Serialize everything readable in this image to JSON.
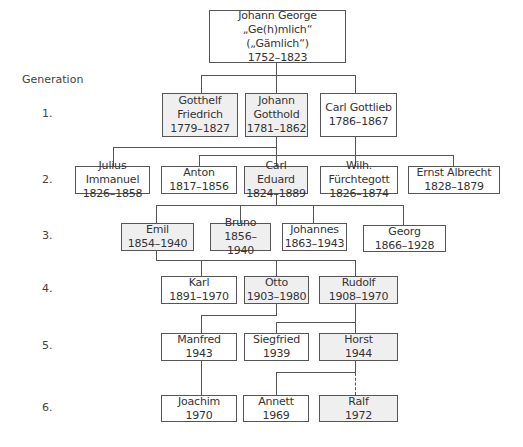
{
  "legend": {
    "generation_label": "Generation",
    "generations": [
      "1.",
      "2.",
      "3.",
      "4.",
      "5.",
      "6."
    ]
  },
  "colors": {
    "box_border": "#555555",
    "shaded_fill": "#efefef",
    "plain_fill": "#ffffff",
    "line": "#555555"
  },
  "root": {
    "lines": [
      "Johann George „Ge(h)mlich“",
      "(„Gämlich“)",
      "1752–1823"
    ],
    "shaded": false
  },
  "people": {
    "gotthelf": {
      "lines": [
        "Gotthelf",
        "Friedrich",
        "1779–1827"
      ],
      "shaded": true,
      "generation": 1
    },
    "johann_gotthold": {
      "lines": [
        "Johann",
        "Gotthold",
        "1781–1862"
      ],
      "shaded": true,
      "generation": 1
    },
    "carl_gottlieb": {
      "lines": [
        "Carl Gottlieb",
        "1786–1867"
      ],
      "shaded": false,
      "generation": 1
    },
    "julius": {
      "lines": [
        "Julius Immanuel",
        "1826–1858"
      ],
      "shaded": false,
      "generation": 2
    },
    "anton": {
      "lines": [
        "Anton",
        "1817–1856"
      ],
      "shaded": false,
      "generation": 2
    },
    "carl_eduard": {
      "lines": [
        "Carl Eduard",
        "1824–1889"
      ],
      "shaded": true,
      "generation": 2
    },
    "wilh": {
      "lines": [
        "Wilh. Fürchtegott",
        "1826–1874"
      ],
      "shaded": false,
      "generation": 2
    },
    "ernst": {
      "lines": [
        "Ernst Albrecht",
        "1828–1879"
      ],
      "shaded": false,
      "generation": 2
    },
    "emil": {
      "lines": [
        "Emil",
        "1854–1940"
      ],
      "shaded": true,
      "generation": 3
    },
    "bruno": {
      "lines": [
        "Bruno",
        "1856–1940"
      ],
      "shaded": true,
      "generation": 3
    },
    "johannes": {
      "lines": [
        "Johannes",
        "1863–1943"
      ],
      "shaded": false,
      "generation": 3
    },
    "georg": {
      "lines": [
        "Georg",
        "1866–1928"
      ],
      "shaded": false,
      "generation": 3
    },
    "karl": {
      "lines": [
        "Karl",
        "1891–1970"
      ],
      "shaded": false,
      "generation": 4
    },
    "otto": {
      "lines": [
        "Otto",
        "1903–1980"
      ],
      "shaded": true,
      "generation": 4
    },
    "rudolf": {
      "lines": [
        "Rudolf",
        "1908–1970"
      ],
      "shaded": true,
      "generation": 4
    },
    "manfred": {
      "lines": [
        "Manfred",
        "1943"
      ],
      "shaded": false,
      "generation": 5
    },
    "siegfried": {
      "lines": [
        "Siegfried",
        "1939"
      ],
      "shaded": false,
      "generation": 5
    },
    "horst": {
      "lines": [
        "Horst",
        "1944"
      ],
      "shaded": true,
      "generation": 5
    },
    "joachim": {
      "lines": [
        "Joachim",
        "1970"
      ],
      "shaded": false,
      "generation": 6
    },
    "annett": {
      "lines": [
        "Annett",
        "1969"
      ],
      "shaded": false,
      "generation": 6
    },
    "ralf": {
      "lines": [
        "Ralf",
        "1972"
      ],
      "shaded": true,
      "generation": 6
    }
  }
}
